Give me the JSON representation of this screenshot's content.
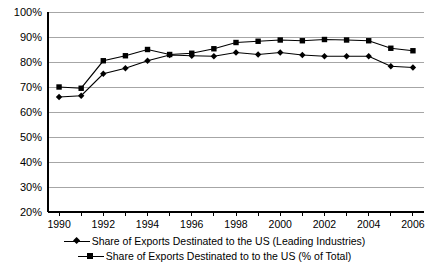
{
  "chart_data": {
    "type": "line",
    "title": "",
    "xlabel": "",
    "ylabel": "",
    "x": [
      1990,
      1991,
      1992,
      1993,
      1994,
      1995,
      1996,
      1997,
      1998,
      1999,
      2000,
      2001,
      2002,
      2003,
      2004,
      2005,
      2006
    ],
    "xtick_labels": [
      "1990",
      "1992",
      "1994",
      "1996",
      "1998",
      "2000",
      "2002",
      "2004",
      "2006"
    ],
    "xtick_values": [
      1990,
      1992,
      1994,
      1996,
      1998,
      2000,
      2002,
      2004,
      2006
    ],
    "xlim": [
      1989.5,
      2006.5
    ],
    "ylim": [
      20,
      100
    ],
    "ytick_labels": [
      "20%",
      "30%",
      "40%",
      "50%",
      "60%",
      "70%",
      "80%",
      "90%",
      "100%"
    ],
    "ytick_values": [
      20,
      30,
      40,
      50,
      60,
      70,
      80,
      90,
      100
    ],
    "grid": "horizontal",
    "legend_position": "bottom",
    "series": [
      {
        "name": "Share of Exports Destinated to the US (Leading Industries)",
        "marker": "diamond",
        "color": "#000000",
        "values": [
          66.0,
          66.5,
          75.3,
          77.5,
          80.5,
          82.8,
          82.5,
          82.3,
          83.8,
          83.0,
          83.8,
          82.8,
          82.3,
          82.3,
          82.3,
          78.3,
          77.8
        ]
      },
      {
        "name": "Share of Exports Destinated to to the US (% of Total)",
        "marker": "square",
        "color": "#000000",
        "values": [
          70.0,
          69.5,
          80.5,
          82.5,
          85.0,
          83.0,
          83.5,
          85.3,
          87.8,
          88.3,
          88.8,
          88.5,
          89.0,
          88.8,
          88.5,
          85.5,
          84.5
        ]
      }
    ]
  },
  "legend": {
    "items": [
      {
        "label": "Share of Exports Destinated to the US (Leading Industries)",
        "marker": "diamond"
      },
      {
        "label": "Share of Exports Destinated to to the US (% of Total)",
        "marker": "square"
      }
    ]
  }
}
